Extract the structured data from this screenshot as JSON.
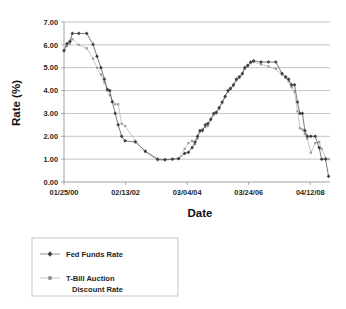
{
  "chart_data": {
    "type": "line",
    "title": "",
    "xlabel": "Date",
    "ylabel": "Rate (%)",
    "ylim": [
      0.0,
      7.0
    ],
    "ytick_labels": [
      "0.00",
      "1.00",
      "2.00",
      "3.00",
      "4.00",
      "5.00",
      "6.00",
      "7.00"
    ],
    "ytick_values": [
      0,
      1,
      2,
      3,
      4,
      5,
      6,
      7
    ],
    "xtick_labels": [
      "01/25/00",
      "02/13/02",
      "03/04/04",
      "03/24/06",
      "04/12/08"
    ],
    "xtick_positions": [
      0,
      25,
      50,
      75,
      100
    ],
    "xlim": [
      0,
      108
    ],
    "grid": "horizontal",
    "legend_position": "below-left",
    "series": [
      {
        "name": "Fed Funds Rate",
        "marker": "diamond",
        "color": "#3f3f3f",
        "points": [
          [
            0.0,
            5.75
          ],
          [
            1.2,
            6.05
          ],
          [
            2.4,
            6.15
          ],
          [
            3.4,
            6.5
          ],
          [
            6.0,
            6.5
          ],
          [
            9.2,
            6.5
          ],
          [
            11.8,
            6.02
          ],
          [
            13.4,
            5.5
          ],
          [
            15.0,
            5.0
          ],
          [
            16.4,
            4.5
          ],
          [
            17.6,
            4.05
          ],
          [
            18.6,
            4.0
          ],
          [
            19.6,
            3.5
          ],
          [
            20.8,
            3.0
          ],
          [
            22.0,
            2.5
          ],
          [
            23.4,
            2.0
          ],
          [
            24.8,
            1.8
          ],
          [
            29.0,
            1.75
          ],
          [
            33.0,
            1.35
          ],
          [
            38.0,
            1.0
          ],
          [
            41.0,
            0.98
          ],
          [
            44.0,
            1.0
          ],
          [
            46.5,
            1.02
          ],
          [
            49.0,
            1.25
          ],
          [
            50.5,
            1.3
          ],
          [
            52.0,
            1.5
          ],
          [
            53.2,
            1.75
          ],
          [
            54.2,
            2.0
          ],
          [
            55.2,
            2.25
          ],
          [
            56.2,
            2.25
          ],
          [
            57.4,
            2.5
          ],
          [
            58.4,
            2.55
          ],
          [
            59.6,
            2.75
          ],
          [
            60.8,
            3.0
          ],
          [
            61.8,
            3.05
          ],
          [
            63.0,
            3.25
          ],
          [
            64.2,
            3.5
          ],
          [
            65.4,
            3.75
          ],
          [
            66.6,
            4.0
          ],
          [
            67.6,
            4.1
          ],
          [
            68.8,
            4.25
          ],
          [
            70.0,
            4.5
          ],
          [
            71.2,
            4.6
          ],
          [
            72.4,
            4.75
          ],
          [
            73.4,
            5.0
          ],
          [
            74.6,
            5.1
          ],
          [
            75.8,
            5.25
          ],
          [
            77.0,
            5.3
          ],
          [
            80.0,
            5.25
          ],
          [
            83.0,
            5.25
          ],
          [
            86.0,
            5.25
          ],
          [
            88.5,
            4.75
          ],
          [
            90.0,
            4.6
          ],
          [
            91.2,
            4.5
          ],
          [
            92.4,
            4.25
          ],
          [
            93.6,
            4.25
          ],
          [
            94.8,
            3.5
          ],
          [
            95.8,
            3.0
          ],
          [
            96.8,
            3.0
          ],
          [
            97.8,
            2.25
          ],
          [
            98.8,
            2.0
          ],
          [
            100.2,
            2.0
          ],
          [
            102.0,
            2.0
          ],
          [
            103.6,
            1.5
          ],
          [
            104.6,
            1.0
          ],
          [
            106.2,
            1.0
          ],
          [
            107.4,
            0.25
          ]
        ]
      },
      {
        "name": "T-Bill Auction Discount Rate",
        "marker": "square",
        "color": "#9a9a9a",
        "points": [
          [
            0.0,
            5.72
          ],
          [
            1.2,
            5.95
          ],
          [
            2.4,
            6.05
          ],
          [
            3.4,
            6.25
          ],
          [
            6.0,
            6.0
          ],
          [
            9.2,
            5.85
          ],
          [
            11.8,
            5.4
          ],
          [
            13.4,
            5.0
          ],
          [
            15.0,
            4.7
          ],
          [
            16.4,
            4.35
          ],
          [
            17.6,
            4.0
          ],
          [
            18.6,
            3.8
          ],
          [
            19.6,
            3.55
          ],
          [
            20.8,
            3.4
          ],
          [
            22.0,
            3.4
          ],
          [
            23.4,
            2.55
          ],
          [
            24.8,
            2.45
          ],
          [
            29.0,
            1.8
          ],
          [
            33.0,
            1.32
          ],
          [
            38.0,
            0.95
          ],
          [
            41.0,
            0.95
          ],
          [
            44.0,
            1.0
          ],
          [
            46.5,
            1.02
          ],
          [
            49.0,
            1.45
          ],
          [
            50.5,
            1.7
          ],
          [
            52.0,
            1.8
          ],
          [
            53.2,
            1.65
          ],
          [
            54.2,
            1.9
          ],
          [
            55.2,
            2.2
          ],
          [
            56.2,
            2.3
          ],
          [
            57.4,
            2.4
          ],
          [
            58.4,
            2.45
          ],
          [
            59.6,
            2.7
          ],
          [
            60.8,
            2.95
          ],
          [
            61.8,
            3.0
          ],
          [
            63.0,
            3.2
          ],
          [
            64.2,
            3.45
          ],
          [
            65.4,
            3.7
          ],
          [
            66.6,
            3.95
          ],
          [
            67.6,
            4.05
          ],
          [
            68.8,
            4.2
          ],
          [
            70.0,
            4.45
          ],
          [
            71.2,
            4.55
          ],
          [
            72.4,
            4.7
          ],
          [
            73.4,
            4.95
          ],
          [
            74.6,
            5.05
          ],
          [
            75.8,
            5.2
          ],
          [
            77.0,
            5.25
          ],
          [
            80.0,
            5.15
          ],
          [
            83.0,
            5.05
          ],
          [
            86.0,
            4.95
          ],
          [
            88.5,
            4.7
          ],
          [
            90.0,
            4.55
          ],
          [
            91.2,
            4.4
          ],
          [
            92.4,
            4.15
          ],
          [
            93.6,
            3.95
          ],
          [
            94.8,
            3.1
          ],
          [
            95.8,
            2.35
          ],
          [
            96.8,
            2.3
          ],
          [
            97.8,
            2.1
          ],
          [
            98.8,
            1.9
          ],
          [
            100.2,
            1.28
          ],
          [
            102.0,
            1.7
          ],
          [
            103.6,
            1.75
          ],
          [
            104.6,
            1.45
          ],
          [
            106.2,
            1.05
          ],
          [
            107.4,
            1.0
          ]
        ]
      }
    ]
  },
  "axes": {
    "y_title": "Rate (%)",
    "x_title": "Date"
  },
  "legend": {
    "entries": [
      {
        "label": "Fed Funds Rate",
        "label_line2": ""
      },
      {
        "label": "T-Bill Auction",
        "label_line2": "Discount Rate"
      }
    ]
  }
}
